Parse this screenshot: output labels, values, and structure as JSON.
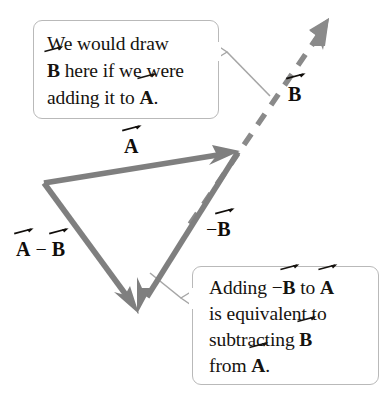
{
  "figure": {
    "colors": {
      "vector_stroke": "#7f7f7f",
      "dashed_stroke": "#8a8a8a",
      "leader_stroke": "#9a9a9a",
      "callout_border": "#b9b9b9",
      "text": "#16130f",
      "background": "#ffffff"
    }
  },
  "callouts": [
    {
      "id": "top",
      "lines": [
        {
          "segments": [
            {
              "type": "text",
              "text": "We would draw"
            }
          ]
        },
        {
          "segments": [
            {
              "type": "vector",
              "text": "B"
            },
            {
              "type": "text",
              "text": " here if we were"
            }
          ]
        },
        {
          "segments": [
            {
              "type": "text",
              "text": "adding it to "
            },
            {
              "type": "vector",
              "text": "A"
            },
            {
              "type": "text",
              "text": "."
            }
          ]
        }
      ],
      "plain_text": "We would draw B here if we were adding it to A."
    },
    {
      "id": "bottom",
      "lines": [
        {
          "segments": [
            {
              "type": "text",
              "text": "Adding "
            },
            {
              "type": "text",
              "text": "−"
            },
            {
              "type": "vector",
              "text": "B"
            },
            {
              "type": "text",
              "text": " to "
            },
            {
              "type": "vector",
              "text": "A"
            }
          ]
        },
        {
          "segments": [
            {
              "type": "text",
              "text": "is equivalent to"
            }
          ]
        },
        {
          "segments": [
            {
              "type": "text",
              "text": "subtracting "
            },
            {
              "type": "vector",
              "text": "B"
            }
          ]
        },
        {
          "segments": [
            {
              "type": "text",
              "text": "from "
            },
            {
              "type": "vector",
              "text": "A"
            },
            {
              "type": "text",
              "text": "."
            }
          ]
        }
      ],
      "plain_text": "Adding −B to A is equivalent to subtracting B from A."
    }
  ],
  "vector_labels": [
    {
      "id": "a",
      "prefix": "",
      "symbol": "A",
      "suffix": "",
      "plain_text": "A"
    },
    {
      "id": "b",
      "prefix": "",
      "symbol": "B",
      "suffix": "",
      "plain_text": "B"
    },
    {
      "id": "negb",
      "prefix": "−",
      "symbol": "B",
      "suffix": "",
      "plain_text": "−B"
    },
    {
      "id": "amb",
      "prefix": "",
      "symbol": "A",
      "middle": " − ",
      "symbol2": "B",
      "plain_text": "A − B"
    }
  ],
  "vectors": [
    {
      "name": "A",
      "style": "solid",
      "from": [
        44,
        183
      ],
      "to": [
        238,
        152
      ]
    },
    {
      "name": "-B",
      "style": "solid",
      "from": [
        238,
        152
      ],
      "to": [
        138,
        312
      ]
    },
    {
      "name": "A-B",
      "style": "solid",
      "from": [
        44,
        183
      ],
      "to": [
        138,
        312
      ]
    },
    {
      "name": "B",
      "style": "dashed",
      "from": [
        197,
        213
      ],
      "to": [
        327,
        22
      ]
    }
  ]
}
